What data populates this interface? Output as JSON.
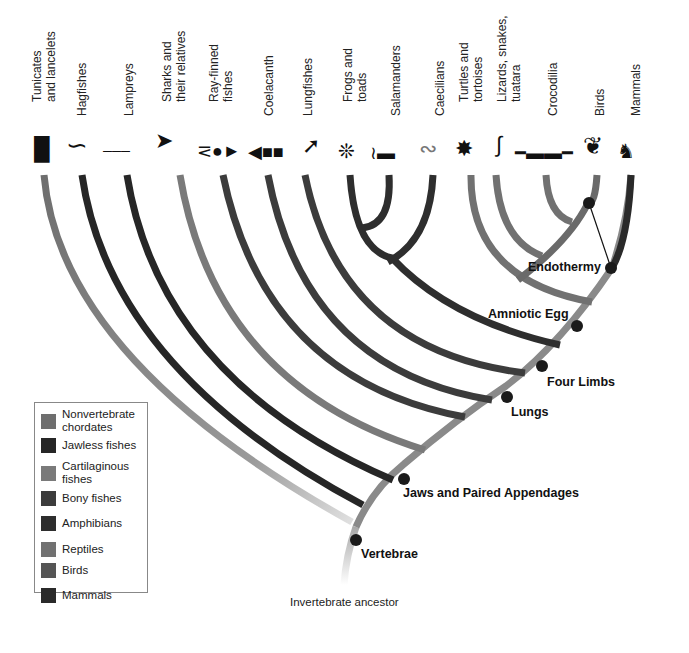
{
  "taxa": [
    {
      "label": "Tunicates\nand lancelets",
      "group": "Nonvertebrate chordates"
    },
    {
      "label": "Hagfishes",
      "group": "Jawless fishes"
    },
    {
      "label": "Lampreys",
      "group": "Jawless fishes"
    },
    {
      "label": "Sharks and\ntheir relatives",
      "group": "Cartilaginous fishes"
    },
    {
      "label": "Ray-finned\nfishes",
      "group": "Bony fishes"
    },
    {
      "label": "Coelacanth",
      "group": "Bony fishes"
    },
    {
      "label": "Lungfishes",
      "group": "Bony fishes"
    },
    {
      "label": "Frogs and\ntoads",
      "group": "Amphibians"
    },
    {
      "label": "Salamanders",
      "group": "Amphibians"
    },
    {
      "label": "Caecilians",
      "group": "Amphibians"
    },
    {
      "label": "Turtles and\ntortoises",
      "group": "Reptiles"
    },
    {
      "label": "Lizards, snakes,\ntuatara",
      "group": "Reptiles"
    },
    {
      "label": "Crocodilia",
      "group": "Reptiles"
    },
    {
      "label": "Birds",
      "group": "Birds"
    },
    {
      "label": "Mammals",
      "group": "Mammals"
    }
  ],
  "traits": {
    "vertebrae": "Vertebrae",
    "jaws": "Jaws and Paired Appendages",
    "lungs": "Lungs",
    "four_limbs": "Four Limbs",
    "amniotic_egg": "Amniotic Egg",
    "endothermy": "Endothermy"
  },
  "root_label": "Invertebrate ancestor",
  "legend": [
    {
      "label": "Nonvertebrate\nchordates",
      "color": "#6e6e6e"
    },
    {
      "label": "Jawless fishes",
      "color": "#262626"
    },
    {
      "label": "Cartilaginous\nfishes",
      "color": "#7a7a7a"
    },
    {
      "label": "Bony fishes",
      "color": "#3c3c3c"
    },
    {
      "label": "Amphibians",
      "color": "#2e2e2e"
    },
    {
      "label": "Reptiles",
      "color": "#717171"
    },
    {
      "label": "Birds",
      "color": "#555555"
    },
    {
      "label": "Mammals",
      "color": "#2a2a2a"
    }
  ],
  "icons": [
    "tunicate-icon",
    "hagfish-icon",
    "lamprey-icon",
    "shark-icon",
    "ray-finned-fish-icon",
    "coelacanth-icon",
    "lungfish-icon",
    "frog-icon",
    "salamander-icon",
    "caecilian-icon",
    "turtle-icon",
    "lizard-icon",
    "crocodile-icon",
    "bird-icon",
    "mammal-icon"
  ]
}
